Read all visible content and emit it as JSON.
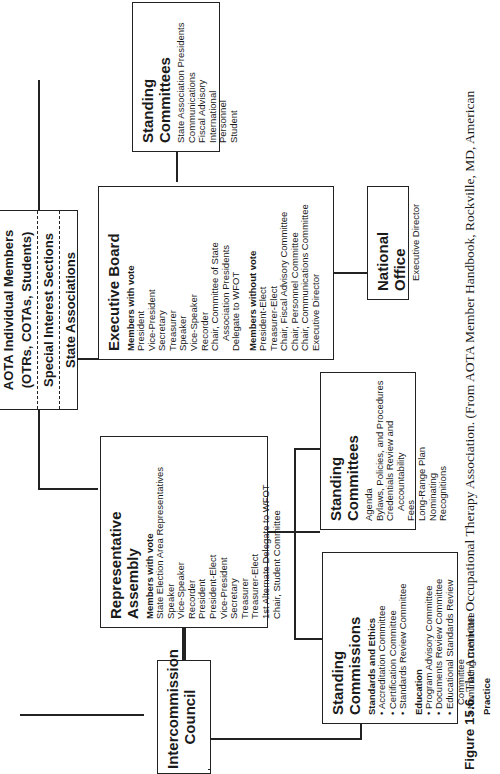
{
  "caption": {
    "label": "Figure 15.6.",
    "text": "The American Occupational Therapy Association. (From AOTA Member Handbook, Rockville, MD, American"
  },
  "members": {
    "line1": "AOTA Individual Members",
    "line2": "(OTRs, COTAs, Students)",
    "section1": "Special Interest Sections",
    "section2": "State Associations"
  },
  "executive_board": {
    "title": "Executive Board",
    "with_vote_label": "Members with vote",
    "with_vote": [
      "President",
      "Vice-President",
      "Secretary",
      "Treasurer",
      "Speaker",
      "Vice-Speaker",
      "Recorder",
      "Chair, Committee of State",
      "Association Presidents",
      "Delegate to WFOT"
    ],
    "without_vote_label": "Members without vote",
    "without_vote": [
      "President-Elect",
      "Treasurer-Elect",
      "Chair, Fiscal Advisory Committee",
      "Chair, Personnel Committee",
      "Chair, Communications Committee",
      "Executive Director"
    ]
  },
  "standing_committees_board": {
    "title": "Standing Committees",
    "items": [
      "State Association Presidents",
      "Communications",
      "Fiscal Advisory",
      "International",
      "Personnel",
      "Student"
    ]
  },
  "national_office": {
    "title": "National Office",
    "items": [
      "Executive Director"
    ]
  },
  "representative_assembly": {
    "title": "Representative Assembly",
    "with_vote_label": "Members with vote",
    "items": [
      "State Election Area Representatives",
      "Speaker",
      "Vice-Speaker",
      "Recorder",
      "President",
      "President-Elect",
      "Vice-President",
      "Secretary",
      "Treasurer",
      "Treasurer-Elect",
      "1st Alternate Delegate to WFOT",
      "Chair, Student Committee"
    ]
  },
  "standing_committees_assembly": {
    "title": "Standing Committees",
    "items": [
      "Agenda",
      "Bylaws, Policies, and Procedures",
      "Credentials Review and",
      "Accountability",
      "Fees",
      "Long-Range Plan",
      "Nominating",
      "Recognitions"
    ]
  },
  "standing_commissions": {
    "title": "Standing Commissions",
    "groups": [
      {
        "label": "Standards and Ethics",
        "items": [
          "Accreditation Committee",
          "Certification Committee",
          "Standards Review Committee"
        ]
      },
      {
        "label": "Education",
        "items": [
          "Program Advisory Committee",
          "Documents Review Committee",
          "Educational Standards Review",
          "Committee",
          "Nominating Committee"
        ]
      },
      {
        "label": "Practice",
        "items": []
      }
    ]
  },
  "intercommission_council": {
    "line1": "Intercommission",
    "line2": "Council"
  }
}
